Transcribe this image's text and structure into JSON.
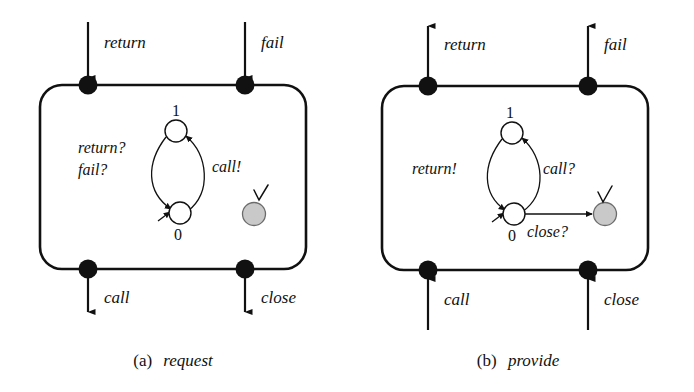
{
  "figure": {
    "background_color": "#ffffff",
    "ink_color": "#111111",
    "final_state_fill": "#c9c9c9"
  },
  "panels": [
    {
      "id": "a",
      "caption_tag": "(a)",
      "caption_name": "request",
      "top_ports": [
        {
          "label": "return",
          "direction": "inbound"
        },
        {
          "label": "fail",
          "direction": "inbound"
        }
      ],
      "bottom_ports": [
        {
          "label": "call",
          "direction": "outbound"
        },
        {
          "label": "close",
          "direction": "outbound"
        }
      ],
      "inner_labels": [
        {
          "text": "return?"
        },
        {
          "text": "fail?"
        },
        {
          "text": "call!"
        }
      ],
      "states": [
        {
          "name": "1",
          "kind": "normal"
        },
        {
          "name": "0",
          "kind": "initial"
        },
        {
          "name": "",
          "kind": "final-accepting",
          "marker": "check"
        }
      ],
      "transitions": [
        {
          "from": "0",
          "to": "1",
          "label": "call!"
        },
        {
          "from": "1",
          "to": "0",
          "label": "return? fail?"
        }
      ]
    },
    {
      "id": "b",
      "caption_tag": "(b)",
      "caption_name": "provide",
      "top_ports": [
        {
          "label": "return",
          "direction": "outbound"
        },
        {
          "label": "fail",
          "direction": "outbound"
        }
      ],
      "bottom_ports": [
        {
          "label": "call",
          "direction": "inbound"
        },
        {
          "label": "close",
          "direction": "inbound"
        }
      ],
      "inner_labels": [
        {
          "text": "return!"
        },
        {
          "text": "call?"
        },
        {
          "text": "close?"
        }
      ],
      "states": [
        {
          "name": "1",
          "kind": "normal"
        },
        {
          "name": "0",
          "kind": "initial"
        },
        {
          "name": "",
          "kind": "final-accepting",
          "marker": "check"
        }
      ],
      "transitions": [
        {
          "from": "0",
          "to": "1",
          "label": "call?"
        },
        {
          "from": "1",
          "to": "0",
          "label": "return!"
        },
        {
          "from": "0",
          "to": "final",
          "label": "close?"
        }
      ]
    }
  ]
}
